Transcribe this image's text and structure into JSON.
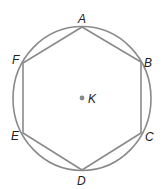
{
  "figure": {
    "colors": {
      "stroke": "#8a8a8a",
      "label": "#222222",
      "center_dot": "#8a8a8a"
    },
    "circle": {
      "cx": 82,
      "cy": 98.5,
      "rx": 69,
      "ry": 72
    },
    "center": {
      "name": "K",
      "x": 82,
      "y": 98,
      "label_x": 88,
      "label_y": 103
    },
    "vertices": [
      {
        "name": "A",
        "x": 82,
        "y": 27,
        "label_x": 78,
        "label_y": 23
      },
      {
        "name": "B",
        "x": 141,
        "y": 62,
        "label_x": 144,
        "label_y": 67
      },
      {
        "name": "C",
        "x": 141,
        "y": 133,
        "label_x": 145,
        "label_y": 141
      },
      {
        "name": "D",
        "x": 82,
        "y": 170,
        "label_x": 77,
        "label_y": 185
      },
      {
        "name": "E",
        "x": 23,
        "y": 133,
        "label_x": 11,
        "label_y": 140
      },
      {
        "name": "F",
        "x": 23,
        "y": 63,
        "label_x": 12,
        "label_y": 64
      }
    ]
  }
}
